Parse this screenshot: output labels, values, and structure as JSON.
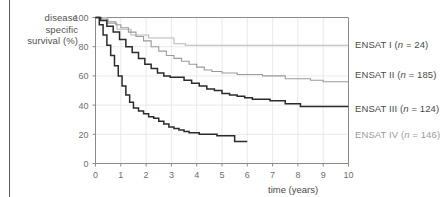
{
  "figure": {
    "y_axis_label_lines": [
      "disease",
      "specific",
      "survival (%)"
    ],
    "x_axis_title": "time (years)"
  },
  "legend": [
    {
      "name": "legend-ensat-1",
      "text": "ENSAT I (n = 24)",
      "color": "#b8b8b8",
      "y": 45
    },
    {
      "name": "legend-ensat-2",
      "text": "ENSAT II (n = 185)",
      "color": "#9a9a9a",
      "y": 75
    },
    {
      "name": "legend-ensat-3",
      "text": "ENSAT III (n = 124)",
      "color": "#2b2b2b",
      "y": 109
    },
    {
      "name": "legend-ensat-4",
      "text": "ENSAT IV (n = 146)",
      "color": "#2b2b2b",
      "y": 135
    }
  ],
  "chart_data": {
    "type": "line",
    "title": "",
    "xlabel": "time (years)",
    "ylabel": "disease specific survival (%)",
    "xlim": [
      0,
      10
    ],
    "ylim": [
      0,
      100
    ],
    "xticks": [
      0,
      1,
      2,
      3,
      4,
      5,
      6,
      7,
      8,
      9,
      10
    ],
    "yticks": [
      0,
      20,
      40,
      60,
      80,
      100
    ],
    "grid": true,
    "legend_position": "right",
    "series": [
      {
        "name": "ENSAT I (n = 24)",
        "color": "#b8b8b8",
        "n": 24,
        "points": [
          [
            0,
            100
          ],
          [
            0.35,
            100
          ],
          [
            0.45,
            96
          ],
          [
            0.75,
            96
          ],
          [
            0.85,
            92
          ],
          [
            1.3,
            92
          ],
          [
            1.4,
            88
          ],
          [
            2.0,
            88
          ],
          [
            2.1,
            86
          ],
          [
            3.0,
            86
          ],
          [
            3.1,
            82
          ],
          [
            3.45,
            82
          ],
          [
            3.55,
            81
          ],
          [
            10,
            81
          ]
        ]
      },
      {
        "name": "ENSAT II (n = 185)",
        "color": "#9a9a9a",
        "n": 185,
        "points": [
          [
            0,
            100
          ],
          [
            0.25,
            99
          ],
          [
            0.5,
            97
          ],
          [
            0.8,
            95
          ],
          [
            1.0,
            93
          ],
          [
            1.3,
            90
          ],
          [
            1.6,
            87
          ],
          [
            1.9,
            84
          ],
          [
            2.2,
            80
          ],
          [
            2.5,
            77
          ],
          [
            2.8,
            74
          ],
          [
            3.1,
            72
          ],
          [
            3.4,
            70
          ],
          [
            3.7,
            68
          ],
          [
            4.0,
            66
          ],
          [
            4.3,
            64
          ],
          [
            4.6,
            63
          ],
          [
            5.0,
            62
          ],
          [
            5.6,
            61
          ],
          [
            6.2,
            61
          ],
          [
            6.6,
            60
          ],
          [
            7.2,
            60
          ],
          [
            7.5,
            58
          ],
          [
            8.2,
            58
          ],
          [
            8.5,
            57
          ],
          [
            9.0,
            56
          ],
          [
            10,
            56
          ]
        ]
      },
      {
        "name": "ENSAT III (n = 124)",
        "color": "#2b2b2b",
        "n": 124,
        "points": [
          [
            0,
            100
          ],
          [
            0.2,
            98
          ],
          [
            0.45,
            94
          ],
          [
            0.7,
            90
          ],
          [
            0.95,
            85
          ],
          [
            1.2,
            80
          ],
          [
            1.45,
            76
          ],
          [
            1.7,
            72
          ],
          [
            1.95,
            68
          ],
          [
            2.2,
            65
          ],
          [
            2.45,
            62
          ],
          [
            2.7,
            60
          ],
          [
            2.95,
            59
          ],
          [
            3.3,
            59
          ],
          [
            3.5,
            57
          ],
          [
            3.8,
            55
          ],
          [
            4.1,
            53
          ],
          [
            4.4,
            51
          ],
          [
            4.7,
            50
          ],
          [
            5.0,
            48
          ],
          [
            5.3,
            47
          ],
          [
            5.6,
            46
          ],
          [
            5.9,
            45
          ],
          [
            6.2,
            44
          ],
          [
            6.6,
            44
          ],
          [
            6.9,
            43
          ],
          [
            7.3,
            43
          ],
          [
            7.5,
            41
          ],
          [
            7.9,
            41
          ],
          [
            8.1,
            39
          ],
          [
            10,
            39
          ]
        ]
      },
      {
        "name": "ENSAT IV (n = 146)",
        "color": "#2b2b2b",
        "n": 146,
        "points": [
          [
            0,
            100
          ],
          [
            0.15,
            95
          ],
          [
            0.3,
            88
          ],
          [
            0.45,
            81
          ],
          [
            0.6,
            74
          ],
          [
            0.75,
            67
          ],
          [
            0.9,
            60
          ],
          [
            1.05,
            53
          ],
          [
            1.2,
            47
          ],
          [
            1.35,
            42
          ],
          [
            1.5,
            38
          ],
          [
            1.7,
            36
          ],
          [
            1.9,
            34
          ],
          [
            2.1,
            32
          ],
          [
            2.3,
            31
          ],
          [
            2.5,
            29
          ],
          [
            2.7,
            27
          ],
          [
            2.9,
            25
          ],
          [
            3.1,
            24
          ],
          [
            3.3,
            23
          ],
          [
            3.5,
            22
          ],
          [
            3.7,
            21
          ],
          [
            3.9,
            21
          ],
          [
            4.1,
            20
          ],
          [
            4.4,
            20
          ],
          [
            4.8,
            19
          ],
          [
            5.2,
            19
          ],
          [
            5.5,
            15
          ],
          [
            6.0,
            15
          ]
        ]
      }
    ]
  }
}
